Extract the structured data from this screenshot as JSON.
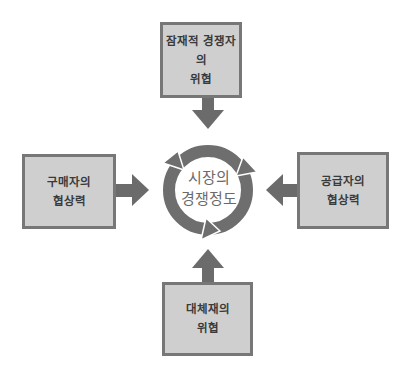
{
  "diagram": {
    "center": {
      "line1": "시장의",
      "line2": "경쟁정도"
    },
    "forces": {
      "top": {
        "line1": "잠재적 경쟁자의",
        "line2": "위협"
      },
      "left": {
        "line1": "구매자의",
        "line2": "협상력"
      },
      "right": {
        "line1": "공급자의",
        "line2": "협상력"
      },
      "bottom": {
        "line1": "대체재의",
        "line2": "위협"
      }
    },
    "colors": {
      "box_fill": "#cfcfcf",
      "box_border": "#777777",
      "arrow": "#6b6b6b",
      "cycle": "#6e6e6e",
      "text": "#3a3a3a"
    }
  }
}
